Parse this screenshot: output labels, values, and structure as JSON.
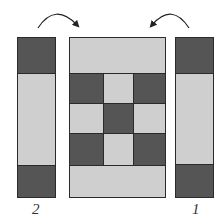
{
  "diagram": {
    "colors": {
      "dark": "#555555",
      "light": "#cfcfcf",
      "outline": "#2a2a2a"
    },
    "left_strip": {
      "label": "2",
      "segments": [
        "dark",
        "light",
        "dark"
      ]
    },
    "right_strip": {
      "label": "1",
      "segments": [
        "dark",
        "light",
        "dark"
      ]
    },
    "center_panel": {
      "top_band": "light",
      "grid": [
        [
          "dark",
          "light",
          "dark"
        ],
        [
          "light",
          "dark",
          "light"
        ],
        [
          "dark",
          "light",
          "dark"
        ]
      ],
      "bottom_band": "light"
    },
    "arrows": [
      {
        "name": "left-strip-rotate-arrow",
        "direction": "clockwise-to-center"
      },
      {
        "name": "right-strip-rotate-arrow",
        "direction": "counterclockwise-to-center"
      }
    ]
  }
}
